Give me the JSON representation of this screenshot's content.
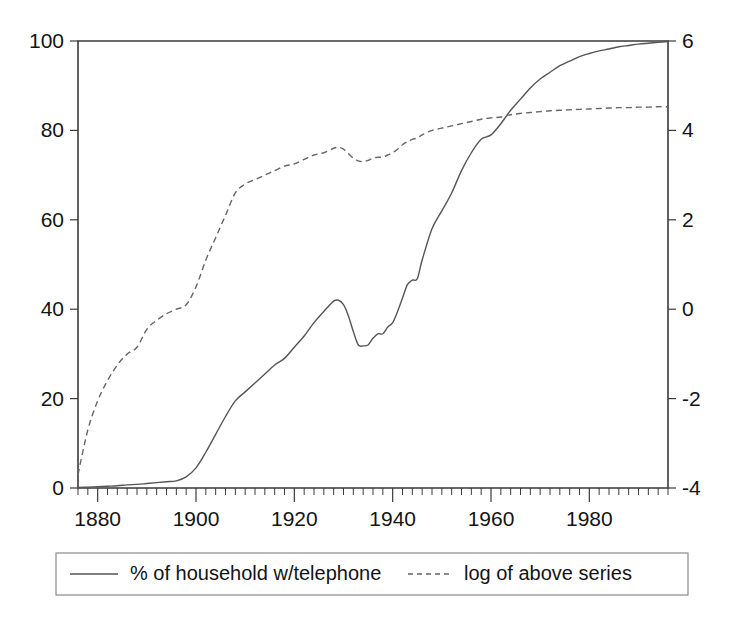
{
  "chart_data": {
    "type": "line",
    "title": "",
    "subtitle": "",
    "xlabel": "",
    "ylabel": "",
    "y2label": "",
    "xlim": [
      1876,
      1996
    ],
    "ylim": [
      0,
      100
    ],
    "y2lim": [
      -4,
      6
    ],
    "grid": false,
    "legend_position": "bottom",
    "x_ticks_major": [
      1880,
      1900,
      1920,
      1940,
      1960,
      1980
    ],
    "x_tick_labels": [
      "1880",
      "1900",
      "1920",
      "1940",
      "1960",
      "1980"
    ],
    "x_ticks_minor_step": 2,
    "y_ticks_left": [
      0,
      20,
      40,
      60,
      80,
      100
    ],
    "y_tick_labels_left": [
      "0",
      "20",
      "40",
      "60",
      "80",
      "100"
    ],
    "y_ticks_right": [
      -4,
      -2,
      0,
      2,
      4,
      6
    ],
    "y_tick_labels_right": [
      "-4",
      "-2",
      "0",
      "2",
      "4",
      "6"
    ],
    "series": [
      {
        "name": "% of household w/telephone",
        "style": "solid",
        "axis": "left",
        "color": "#555555",
        "x": [
          1876,
          1878,
          1880,
          1882,
          1884,
          1886,
          1888,
          1890,
          1892,
          1894,
          1896,
          1898,
          1900,
          1902,
          1904,
          1906,
          1908,
          1910,
          1912,
          1914,
          1916,
          1918,
          1920,
          1922,
          1924,
          1926,
          1928,
          1929,
          1930,
          1931,
          1932,
          1933,
          1934,
          1935,
          1936,
          1937,
          1938,
          1939,
          1940,
          1941,
          1942,
          1943,
          1944,
          1945,
          1946,
          1948,
          1950,
          1952,
          1954,
          1956,
          1958,
          1960,
          1962,
          1964,
          1966,
          1968,
          1970,
          1972,
          1974,
          1976,
          1978,
          1980,
          1982,
          1984,
          1986,
          1988,
          1990,
          1992,
          1994,
          1996
        ],
        "y": [
          0.1,
          0.2,
          0.3,
          0.4,
          0.5,
          0.7,
          0.8,
          1.0,
          1.2,
          1.4,
          1.6,
          2.5,
          4.5,
          8.0,
          12.0,
          16.0,
          19.5,
          21.5,
          23.5,
          25.5,
          27.5,
          29.0,
          31.5,
          34.0,
          37.0,
          39.5,
          41.8,
          42.0,
          41.0,
          38.5,
          35.0,
          32.0,
          31.8,
          32.0,
          33.5,
          34.5,
          34.5,
          36.0,
          37.0,
          39.5,
          42.5,
          45.5,
          46.5,
          46.8,
          51.0,
          58.0,
          62.0,
          66.0,
          71.0,
          75.0,
          78.0,
          79.0,
          81.5,
          84.5,
          87.0,
          89.5,
          91.5,
          93.0,
          94.5,
          95.5,
          96.5,
          97.2,
          97.8,
          98.2,
          98.7,
          99.0,
          99.3,
          99.5,
          99.7,
          99.9
        ]
      },
      {
        "name": "log of above series",
        "style": "dashed",
        "axis": "right",
        "color": "#666666",
        "x": [
          1876,
          1878,
          1880,
          1882,
          1884,
          1886,
          1888,
          1890,
          1892,
          1894,
          1896,
          1898,
          1900,
          1902,
          1904,
          1906,
          1908,
          1910,
          1912,
          1914,
          1916,
          1918,
          1920,
          1922,
          1924,
          1926,
          1928,
          1929,
          1930,
          1931,
          1932,
          1933,
          1934,
          1935,
          1936,
          1937,
          1938,
          1939,
          1940,
          1941,
          1942,
          1943,
          1944,
          1945,
          1946,
          1948,
          1950,
          1952,
          1954,
          1956,
          1958,
          1960,
          1962,
          1964,
          1966,
          1968,
          1970,
          1972,
          1974,
          1976,
          1978,
          1980,
          1982,
          1984,
          1986,
          1988,
          1990,
          1992,
          1994,
          1996
        ],
        "y": [
          -3.7,
          -2.7,
          -2.05,
          -1.6,
          -1.25,
          -1.0,
          -0.85,
          -0.45,
          -0.25,
          -0.1,
          0.0,
          0.1,
          0.5,
          1.1,
          1.6,
          2.1,
          2.6,
          2.8,
          2.9,
          3.0,
          3.1,
          3.2,
          3.25,
          3.35,
          3.45,
          3.5,
          3.6,
          3.62,
          3.58,
          3.48,
          3.38,
          3.32,
          3.3,
          3.33,
          3.38,
          3.4,
          3.4,
          3.45,
          3.5,
          3.58,
          3.68,
          3.75,
          3.8,
          3.83,
          3.9,
          4.0,
          4.05,
          4.1,
          4.15,
          4.2,
          4.25,
          4.28,
          4.3,
          4.35,
          4.38,
          4.4,
          4.42,
          4.44,
          4.45,
          4.46,
          4.47,
          4.48,
          4.49,
          4.5,
          4.51,
          4.51,
          4.52,
          4.52,
          4.53,
          4.53
        ]
      }
    ],
    "legend_entries": [
      {
        "label": "% of household w/telephone",
        "style": "solid"
      },
      {
        "label": "log of above series",
        "style": "dashed"
      }
    ],
    "annotations": {
      "solid_peak_year": 1929,
      "solid_peak_value": 42,
      "solid_trough_year": 1933,
      "solid_trough_value": 32,
      "crossover_year": 1964
    }
  }
}
